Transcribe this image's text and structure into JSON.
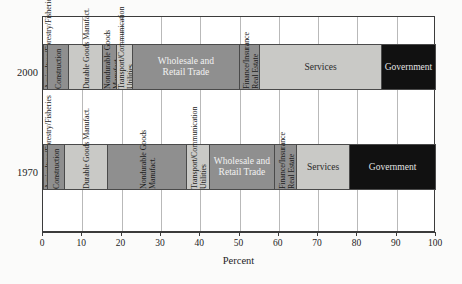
{
  "chart_data": {
    "type": "bar",
    "orientation": "horizontal",
    "stacked": true,
    "title": "",
    "xlabel": "Percent",
    "ylabel": "",
    "xlim": [
      0,
      100
    ],
    "xticks": [
      0,
      10,
      20,
      30,
      40,
      50,
      60,
      70,
      80,
      90,
      100
    ],
    "xticklabels": [
      "0",
      "10",
      "20",
      "30",
      "40",
      "50",
      "60",
      "70",
      "80",
      "90",
      "100"
    ],
    "grid": true,
    "legend": "none",
    "categories": [
      "2000",
      "1970"
    ],
    "series": [
      {
        "name": "Agriculture/Forestry/Fisheries",
        "values": [
          1.0,
          1.0
        ]
      },
      {
        "name": "Construction",
        "values": [
          5.4,
          4.3
        ]
      },
      {
        "name": "Durable Goods Manufact.",
        "values": [
          8.7,
          10.9
        ]
      },
      {
        "name": "Nondurable Goods Manufact.",
        "values": [
          3.6,
          20.1
        ]
      },
      {
        "name": "Transport/Communication/Utilities",
        "values": [
          4.1,
          5.9
        ]
      },
      {
        "name": "Wholesale and Retail Trade",
        "values": [
          27.2,
          16.5
        ]
      },
      {
        "name": "Finance/Insurance/Real Estate",
        "values": [
          5.1,
          5.6
        ]
      },
      {
        "name": "Services",
        "values": [
          31.0,
          13.5
        ]
      },
      {
        "name": "Government",
        "values": [
          14.0,
          22.1
        ]
      }
    ],
    "bars": [
      {
        "category": "2000",
        "segments": [
          {
            "label": "Agriculture/Forestry/Fisheries",
            "start": 0.0,
            "end": 1.0,
            "fill": "dark",
            "label_orientation": "vertical"
          },
          {
            "label": "Construction",
            "start": 1.0,
            "end": 6.4,
            "fill": "dark",
            "label_orientation": "vertical"
          },
          {
            "label": "Durable Goods Manufact.",
            "start": 6.4,
            "end": 15.0,
            "fill": "light",
            "label_orientation": "vertical"
          },
          {
            "label": "Nondurable Goods\nManufact.",
            "start": 15.0,
            "end": 18.6,
            "fill": "dark",
            "label_orientation": "vertical"
          },
          {
            "label": "Transport/Communication\nUtilities",
            "start": 18.6,
            "end": 22.6,
            "fill": "light",
            "label_orientation": "vertical"
          },
          {
            "label": "Wholesale and\nRetail Trade",
            "start": 22.6,
            "end": 49.9,
            "fill": "dark",
            "label_orientation": "horizontal"
          },
          {
            "label": "Finance/Insurance\nReal Estate",
            "start": 49.9,
            "end": 55.0,
            "fill": "dark",
            "label_orientation": "vertical"
          },
          {
            "label": "Services",
            "start": 55.0,
            "end": 86.0,
            "fill": "light",
            "label_orientation": "horizontal"
          },
          {
            "label": "Government",
            "start": 86.0,
            "end": 100.0,
            "fill": "black",
            "label_orientation": "horizontal"
          }
        ]
      },
      {
        "category": "1970",
        "segments": [
          {
            "label": "Agriculture/Forestry/Fisheries",
            "start": 0.0,
            "end": 1.0,
            "fill": "dark",
            "label_orientation": "vertical"
          },
          {
            "label": "Construction",
            "start": 1.0,
            "end": 5.3,
            "fill": "dark",
            "label_orientation": "vertical"
          },
          {
            "label": "Durable Goods Manufact.",
            "start": 5.3,
            "end": 16.3,
            "fill": "light",
            "label_orientation": "vertical"
          },
          {
            "label": "Nondurable Goods\nManufact.",
            "start": 16.3,
            "end": 36.4,
            "fill": "dark",
            "label_orientation": "vertical"
          },
          {
            "label": "Transport/Communication\nUtilities",
            "start": 36.4,
            "end": 42.2,
            "fill": "light",
            "label_orientation": "vertical"
          },
          {
            "label": "Wholesale and\nRetail Trade",
            "start": 42.2,
            "end": 58.8,
            "fill": "dark",
            "label_orientation": "horizontal"
          },
          {
            "label": "Finance/Insurance\nReal Estate",
            "start": 58.8,
            "end": 64.4,
            "fill": "dark",
            "label_orientation": "vertical"
          },
          {
            "label": "Services",
            "start": 64.4,
            "end": 77.9,
            "fill": "light",
            "label_orientation": "horizontal"
          },
          {
            "label": "Government",
            "start": 77.9,
            "end": 100.0,
            "fill": "black",
            "label_orientation": "horizontal"
          }
        ]
      }
    ],
    "colors": {
      "dark": "#8f8f8f",
      "light": "#c9c9c6",
      "black": "#111111",
      "axis": "#3b3b3b",
      "grid": "#b9b9b9",
      "text": "#1d1d1d"
    }
  }
}
